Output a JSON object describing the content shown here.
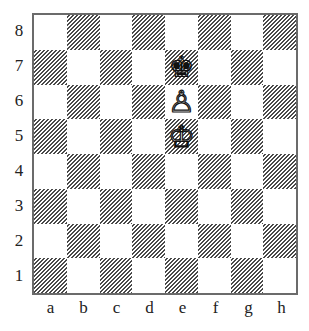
{
  "diagram": {
    "type": "chess-position",
    "ranks": [
      "8",
      "7",
      "6",
      "5",
      "4",
      "3",
      "2",
      "1"
    ],
    "files": [
      "a",
      "b",
      "c",
      "d",
      "e",
      "f",
      "g",
      "h"
    ],
    "pieces": [
      {
        "square": "e7",
        "color": "black",
        "piece": "king",
        "glyph": "♚"
      },
      {
        "square": "e6",
        "color": "white",
        "piece": "pawn",
        "glyph": "♙"
      },
      {
        "square": "e5",
        "color": "white",
        "piece": "king",
        "glyph": "♔"
      }
    ],
    "colors": {
      "border": "#6b6b6b",
      "dark_hatch": "#4a4a4a",
      "light": "#ffffff"
    }
  }
}
